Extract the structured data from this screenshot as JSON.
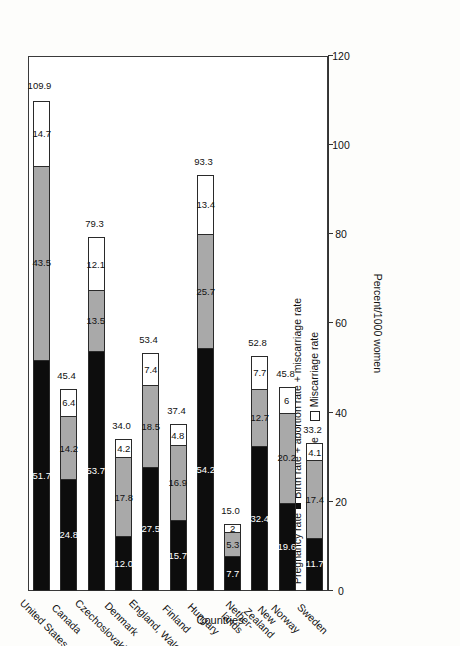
{
  "chart_data": {
    "type": "bar",
    "orientation": "horizontal-stacked",
    "title": "",
    "xlabel": "Countries",
    "ylabel": "Percent/1000 women",
    "ylim": [
      0,
      120
    ],
    "ticks": [
      "120",
      "100",
      "80",
      "60",
      "40",
      "20",
      "0"
    ],
    "tick_values": [
      120,
      100,
      80,
      60,
      40,
      20,
      0
    ],
    "grid": false,
    "legend_position": "top-left",
    "legend_title": "Pregnancy rate",
    "legend_formula": "Birth rate + abortion rate + miscarriage rate",
    "legend": [
      {
        "name": "Birth rate",
        "color": "#0d0d0d"
      },
      {
        "name": "Abortion rate",
        "color": "#a9a9a9"
      },
      {
        "name": "Miscarriage rate",
        "color": "#ffffff"
      }
    ],
    "categories": [
      "United States",
      "Canada",
      "Czechoslovakia",
      "Denmark",
      "England, Wales",
      "Finland",
      "Hungary",
      "Nether-\nlands",
      "New\nZealand",
      "Norway",
      "Sweden"
    ],
    "series": [
      {
        "name": "Birth rate",
        "values": [
          51.7,
          24.8,
          53.7,
          12.0,
          27.5,
          15.7,
          54.2,
          7.7,
          32.4,
          19.6,
          11.7
        ]
      },
      {
        "name": "Abortion rate",
        "values": [
          43.5,
          14.2,
          13.5,
          17.8,
          18.5,
          16.9,
          25.7,
          5.3,
          12.7,
          20.2,
          17.4
        ]
      },
      {
        "name": "Miscarriage rate",
        "values": [
          14.7,
          6.4,
          12.1,
          4.2,
          7.4,
          4.8,
          13.4,
          2.0,
          7.7,
          6.0,
          4.1
        ]
      }
    ],
    "totals": [
      109.9,
      45.4,
      79.3,
      34.0,
      53.4,
      37.4,
      93.3,
      15.0,
      52.8,
      45.8,
      33.2
    ],
    "value_labels": {
      "United States": [
        "51.7",
        "43.5",
        "14.7"
      ],
      "Canada": [
        "24.8",
        "14.2",
        "6.4"
      ],
      "Czechoslovakia": [
        "53.7",
        "13.5",
        "12.1"
      ],
      "Denmark": [
        "12.0",
        "17.8",
        "4.2"
      ],
      "England, Wales": [
        "27.5",
        "18.5",
        "7.4"
      ],
      "Finland": [
        "15.7",
        "16.9",
        "4.8"
      ],
      "Hungary": [
        "54.2",
        "25.7",
        "13.4"
      ],
      "Netherlands": [
        "7.7",
        "5.3",
        "2"
      ],
      "New Zealand": [
        "32.4",
        "12.7",
        "7.7"
      ],
      "Norway": [
        "19.6",
        "20.2",
        "6"
      ],
      "Sweden": [
        "11.7",
        "17.4",
        "4.1"
      ]
    },
    "total_labels": [
      "109.9",
      "45.4",
      "79.3",
      "34.0",
      "53.4",
      "37.4",
      "93.3",
      "15.0",
      "52.8",
      "45.8",
      "33.2"
    ]
  },
  "axis": {
    "value_title": "Percent/1000 women",
    "category_title": "Countries"
  }
}
